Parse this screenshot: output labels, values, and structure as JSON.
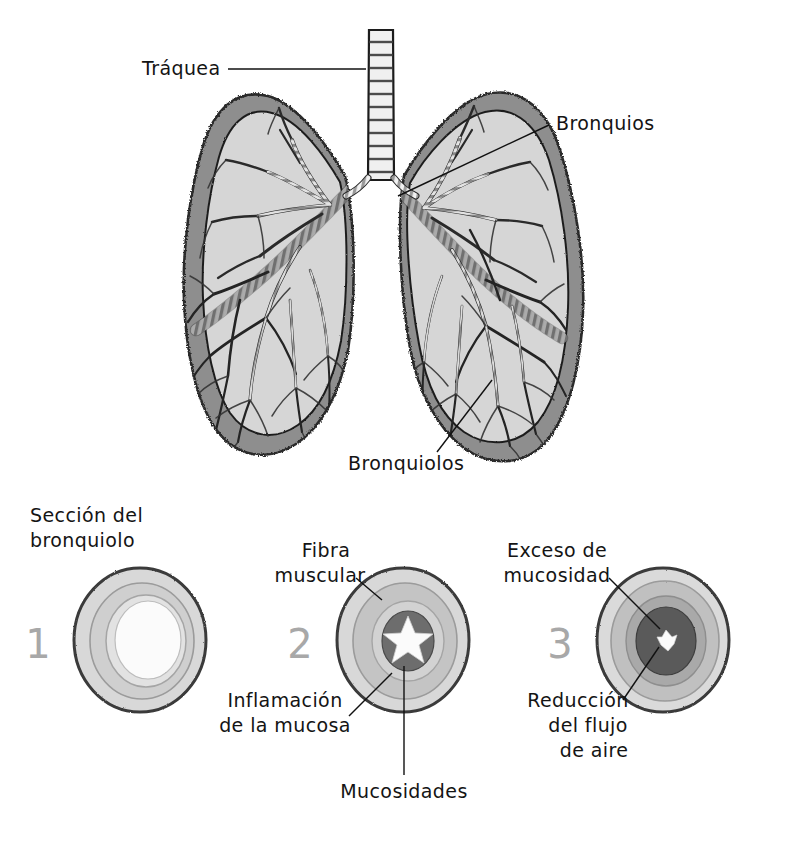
{
  "figure": {
    "language": "es",
    "style": "hand-drawn grayscale anatomical illustration"
  },
  "palette": {
    "ink": "#141414",
    "numeral_gray": "#a8a8a8",
    "lung_wall": "#8e8e8e",
    "lung_interior": "#d6d6d6",
    "airway_light": "#f2f2f2",
    "airway_band": "#9a9a9a",
    "ring_outer": "#d8d8d8",
    "ring_muscle": "#b9b9b9",
    "ring_mucosa": "#cdcdcd",
    "lumen_open": "#fafafa",
    "mucus_dark": "#6d6d6d",
    "mucus_darker": "#4f4f4f",
    "outline_dark": "#3a3a3a"
  },
  "lung_diagram": {
    "labels": [
      {
        "id": "traquea",
        "text": "Tráquea",
        "x": 142,
        "y": 75,
        "anchor": "start",
        "leader": {
          "x1": 228,
          "y1": 69,
          "x2": 366,
          "y2": 69
        }
      },
      {
        "id": "bronquios",
        "text": "Bronquios",
        "x": 556,
        "y": 130,
        "anchor": "start",
        "leader": {
          "x1": 549,
          "y1": 125,
          "x2": 398,
          "y2": 196
        }
      },
      {
        "id": "bronquiolos",
        "text": "Bronquiolos",
        "x": 348,
        "y": 470,
        "anchor": "start",
        "leader": {
          "x1": 437,
          "y1": 452,
          "x2": 492,
          "y2": 380
        }
      }
    ]
  },
  "cross_sections": {
    "heading": {
      "line1": "Sección del",
      "line2": "bronquiolo",
      "x": 30,
      "y": 522
    },
    "items": [
      {
        "number": "1",
        "state": "normal",
        "cx": 140,
        "cy": 640,
        "number_x": 38,
        "number_y": 658,
        "layers": [
          {
            "name": "outer-wall",
            "rx": 66,
            "ry": 72,
            "fill": "#d8d8d8"
          },
          {
            "name": "muscle-ring",
            "rx": 52,
            "ry": 58,
            "fill": "#cfcfcf"
          },
          {
            "name": "mucosa-ring",
            "rx": 40,
            "ry": 46,
            "fill": "#e2e2e2"
          },
          {
            "name": "lumen",
            "rx": 33,
            "ry": 39,
            "fill": "#fbfbfb"
          }
        ]
      },
      {
        "number": "2",
        "state": "inflamado",
        "cx": 403,
        "cy": 640,
        "number_x": 300,
        "number_y": 658,
        "layers": [
          {
            "name": "outer-wall",
            "rx": 66,
            "ry": 72,
            "fill": "#d8d8d8"
          },
          {
            "name": "muscle-ring",
            "rx": 52,
            "ry": 58,
            "fill": "#c4c4c4"
          },
          {
            "name": "mucosa-ring",
            "rx": 36,
            "ry": 40,
            "fill": "#d2d2d2"
          },
          {
            "name": "mucus",
            "rx": 26,
            "ry": 30,
            "fill": "#6d6d6d"
          },
          {
            "name": "lumen-star",
            "fill": "#fbfbfb"
          }
        ]
      },
      {
        "number": "3",
        "state": "obstruido",
        "cx": 663,
        "cy": 640,
        "number_x": 560,
        "number_y": 658,
        "layers": [
          {
            "name": "outer-wall",
            "rx": 66,
            "ry": 72,
            "fill": "#dadada"
          },
          {
            "name": "muscle-ring",
            "rx": 54,
            "ry": 60,
            "fill": "#c0c0c0"
          },
          {
            "name": "mucosa-ring",
            "rx": 40,
            "ry": 45,
            "fill": "#a9a9a9"
          },
          {
            "name": "mucus",
            "rx": 30,
            "ry": 34,
            "fill": "#5a5a5a"
          },
          {
            "name": "lumen-tiny",
            "rx": 9,
            "ry": 10,
            "fill": "#fbfbfb"
          }
        ]
      }
    ],
    "labels": [
      {
        "id": "fibra-muscular",
        "line1": "Fibra",
        "line2": "muscular",
        "x": 326,
        "y": 557,
        "anchor": "middle",
        "leader": {
          "x1": 356,
          "y1": 578,
          "x2": 382,
          "y2": 600
        }
      },
      {
        "id": "inflamacion-mucosa",
        "line1": "Inflamación",
        "line2": "de la mucosa",
        "x": 285,
        "y": 707,
        "anchor": "middle",
        "leader": {
          "x1": 349,
          "y1": 716,
          "x2": 392,
          "y2": 673
        }
      },
      {
        "id": "mucosidades",
        "line1": "Mucosidades",
        "line2": "",
        "x": 404,
        "y": 798,
        "anchor": "middle",
        "leader": {
          "x1": 404,
          "y1": 775,
          "x2": 404,
          "y2": 666
        }
      },
      {
        "id": "exceso-mucosidad",
        "line1": "Exceso de",
        "line2": "mucosidad",
        "x": 557,
        "y": 557,
        "anchor": "middle",
        "leader": {
          "x1": 609,
          "y1": 578,
          "x2": 660,
          "y2": 629
        }
      },
      {
        "id": "reduccion-flujo",
        "line1": "Reducción",
        "line2": "del flujo",
        "line3": "de aire",
        "x": 578,
        "y": 707,
        "anchor": "middle",
        "leader": {
          "x1": 623,
          "y1": 700,
          "x2": 659,
          "y2": 647
        }
      }
    ]
  }
}
